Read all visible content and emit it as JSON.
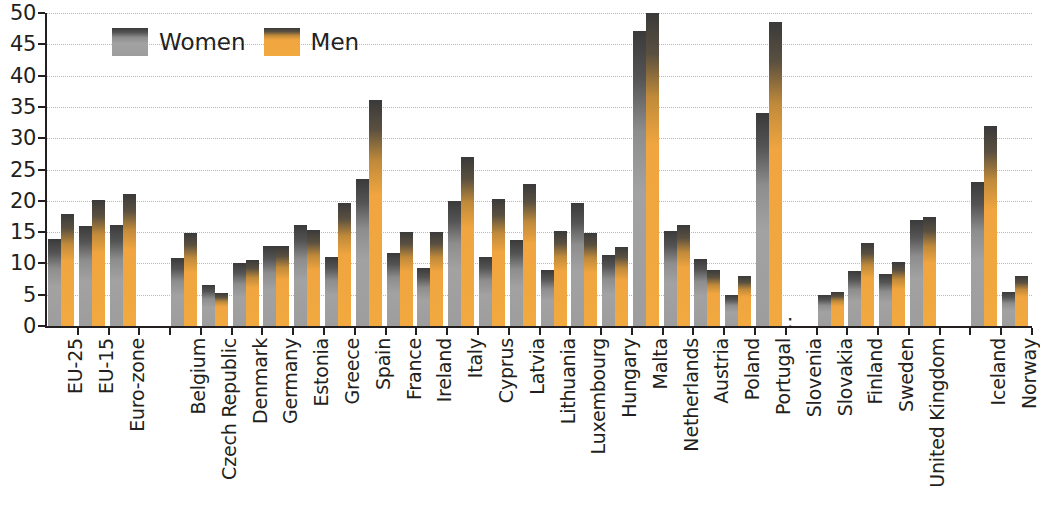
{
  "chart_data": {
    "type": "bar",
    "title": "",
    "subtitle": "",
    "xlabel": "",
    "ylabel": "",
    "ylim": [
      0,
      50
    ],
    "ytick_step": 5,
    "yticks": [
      0,
      5,
      10,
      15,
      20,
      25,
      30,
      35,
      40,
      45,
      50
    ],
    "grid": true,
    "legend_position": "top-left",
    "missing_marker": ":",
    "categories": [
      "EU-25",
      "EU-15",
      "Euro-zone",
      "",
      "Belgium",
      "Czech Republic",
      "Denmark",
      "Germany",
      "Estonia",
      "Greece",
      "Spain",
      "France",
      "Ireland",
      "Italy",
      "Cyprus",
      "Latvia",
      "Lithuania",
      "Luxembourg",
      "Hungary",
      "Malta",
      "Netherlands",
      "Austria",
      "Poland",
      "Portugal",
      "Slovenia",
      "Slovakia",
      "Finland",
      "Sweden",
      "United Kingdom",
      "",
      "Iceland",
      "Norway"
    ],
    "series": [
      {
        "name": "Women",
        "color": "#9d9d9d",
        "values": [
          13.9,
          15.9,
          16.1,
          null,
          10.9,
          6.5,
          10.0,
          12.8,
          16.1,
          11.0,
          23.5,
          11.7,
          9.2,
          20.0,
          11.0,
          13.7,
          9.0,
          19.7,
          11.4,
          47.1,
          15.1,
          10.7,
          5.0,
          34.0,
          null,
          5.0,
          8.8,
          8.3,
          17.0,
          null,
          23.0,
          5.5
        ]
      },
      {
        "name": "Men",
        "color": "#f2a93f",
        "values": [
          17.9,
          20.1,
          21.1,
          null,
          14.9,
          5.2,
          10.5,
          12.8,
          15.4,
          19.7,
          36.1,
          15.0,
          15.0,
          27.0,
          20.3,
          22.7,
          15.2,
          14.9,
          12.7,
          50.0,
          16.2,
          9.0,
          8.0,
          48.5,
          null,
          5.4,
          13.2,
          10.2,
          17.4,
          null,
          32.0,
          8.0
        ]
      }
    ]
  },
  "legend": {
    "items": [
      {
        "label": "Women",
        "color": "#9d9d9d"
      },
      {
        "label": "Men",
        "color": "#f2a93f"
      }
    ]
  },
  "axis": {
    "y_tick_labels": [
      "50",
      "45",
      "40",
      "35",
      "30",
      "25",
      "20",
      "15",
      "10",
      "5",
      "0"
    ]
  }
}
